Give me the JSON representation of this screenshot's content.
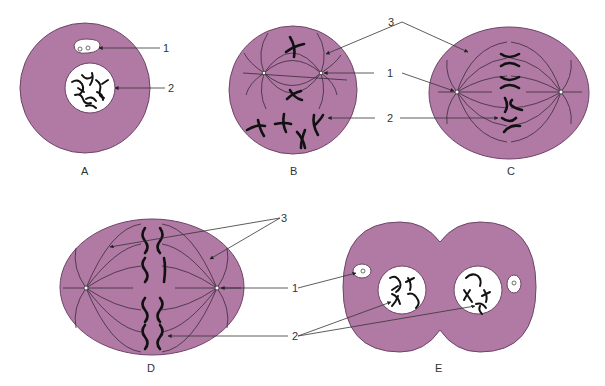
{
  "figure": {
    "fill_color": "#b07aa5",
    "panels": [
      {
        "id": "A",
        "caption": "A",
        "labels": [
          "1",
          "2"
        ]
      },
      {
        "id": "B",
        "caption": "B",
        "labels": [
          "3",
          "1",
          "2"
        ]
      },
      {
        "id": "C",
        "caption": "C",
        "labels": [
          "3",
          "1",
          "2"
        ]
      },
      {
        "id": "D",
        "caption": "D",
        "labels": [
          "3",
          "1",
          "2"
        ]
      },
      {
        "id": "E",
        "caption": "E",
        "labels": [
          "1",
          "2"
        ]
      }
    ]
  }
}
